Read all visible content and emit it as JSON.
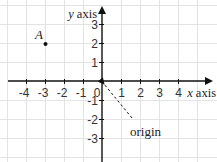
{
  "diagram": {
    "type": "coordinate-grid",
    "grid": {
      "x_range": [
        -5,
        5
      ],
      "y_range": [
        -4,
        4
      ],
      "line_color": "#e6e6e6",
      "axis_color": "#111111"
    },
    "axes": {
      "x_label_prefix": "x",
      "x_label_suffix": " axis",
      "y_label_prefix": "y",
      "y_label_suffix": " axis",
      "x_ticks": [
        "-4",
        "-3",
        "-2",
        "-1",
        "0",
        "1",
        "2",
        "3",
        "4"
      ],
      "y_ticks": [
        "3",
        "2",
        "1",
        "-1",
        "-2",
        "-3"
      ]
    },
    "points": [
      {
        "label": "A",
        "x": -3,
        "y": 2
      }
    ],
    "annotations": [
      {
        "label": "origin",
        "points_to": [
          0,
          0
        ],
        "style": "dashed-arrow"
      }
    ]
  }
}
